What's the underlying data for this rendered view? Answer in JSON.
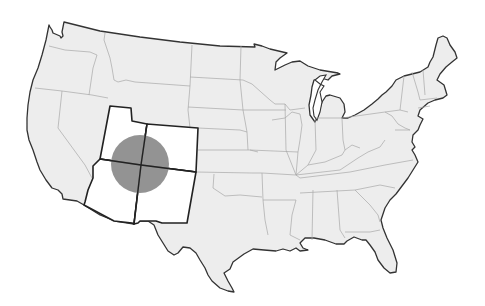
{
  "map": {
    "title": "United States",
    "highlighted_region": "Four Corners",
    "highlighted_states": [
      "Utah",
      "Colorado",
      "Arizona",
      "New Mexico"
    ],
    "marker": {
      "shape": "circle",
      "center": [
        140,
        164
      ],
      "radius": 29,
      "color": "#8a8a8a"
    },
    "colors": {
      "land": "#ededed",
      "highlight": "#ffffff",
      "coast_outline": "#333333",
      "state_border": "#a8a8a8",
      "background": "#ffffff"
    }
  }
}
